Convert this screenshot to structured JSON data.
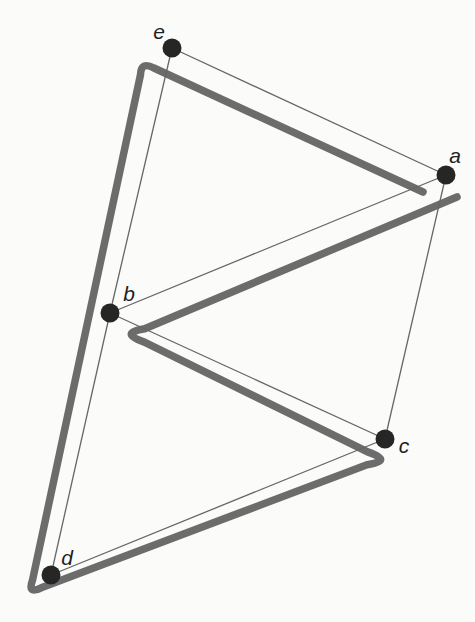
{
  "figure": {
    "background_color": "#fbfbf9",
    "thin_line_color": "#666666",
    "thin_line_width": 1.3,
    "thick_line_color": "#5f5f5f",
    "thick_line_width": 7.5,
    "dot_color": "#262626",
    "dot_radius": 9.5,
    "label_color": "#1f1f1f",
    "nodes": [
      {
        "id": "a",
        "label": "a",
        "x": 446,
        "y": 175,
        "label_x": 455,
        "label_y": 163
      },
      {
        "id": "b",
        "label": "b",
        "x": 110,
        "y": 313,
        "label_x": 129,
        "label_y": 301
      },
      {
        "id": "c",
        "label": "c",
        "x": 385,
        "y": 439,
        "label_x": 404,
        "label_y": 453
      },
      {
        "id": "d",
        "label": "d",
        "x": 51,
        "y": 575,
        "label_x": 67,
        "label_y": 565
      },
      {
        "id": "e",
        "label": "e",
        "x": 172,
        "y": 48,
        "label_x": 159,
        "label_y": 39
      }
    ],
    "thin_edges": [
      [
        "e",
        "a"
      ],
      [
        "e",
        "b"
      ],
      [
        "a",
        "b"
      ],
      [
        "a",
        "c"
      ],
      [
        "b",
        "c"
      ],
      [
        "b",
        "d"
      ],
      [
        "c",
        "d"
      ]
    ],
    "thick_trace": {
      "vertex_sequence": [
        "a",
        "e",
        "d",
        "c",
        "b",
        "a"
      ],
      "path": "M 423 192 L 153.9 68 Q 141 61 140.5 74.7 L 32.5 580.3 Q 27 595 41.2 587.8 L 367 464.7 Q 394 461 367.6 451.9 L 144.4 342.1 Q 118 333 144.7 328.8 L 457 197"
    }
  }
}
